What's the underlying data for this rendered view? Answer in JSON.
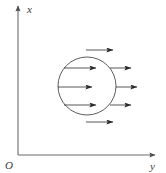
{
  "figure": {
    "background_color": "#ffffff",
    "width": 166,
    "height": 173,
    "stroke_color": "#4a4a4a",
    "axis_color": "#6a6a6a",
    "arrow_color": "#2b2b2b"
  },
  "axes": {
    "vertical": {
      "label": "x",
      "label_x": 27,
      "label_y": 13,
      "x": 18,
      "y_top": 4,
      "y_bottom": 155,
      "arrow_direction": "up"
    },
    "horizontal": {
      "label": "y",
      "label_x": 152,
      "label_y": 169,
      "y": 155,
      "x_left": 18,
      "x_right": 157,
      "arrow_direction": "right"
    },
    "origin": {
      "label": "O",
      "label_x": 6,
      "label_y": 168
    }
  },
  "circle": {
    "name": "flux-circle",
    "cx": 87,
    "cy": 86,
    "r": 29,
    "fill": "none",
    "stroke": "#4a4a4a",
    "stroke_width": 0.9
  },
  "chart_data": {
    "type": "scatter",
    "xlabel": "y",
    "ylabel": "x",
    "grid": false,
    "legend": null,
    "annotations": [
      "O",
      "x",
      "y"
    ],
    "vectors": [
      {
        "id": "arrow-top-tangent",
        "x_start": 86,
        "y": 50,
        "x_end": 116,
        "direction": "right",
        "region": "tangent-top"
      },
      {
        "id": "arrow-inner-upper",
        "x_start": 64,
        "y": 68,
        "x_end": 99,
        "direction": "right",
        "region": "inside-circle"
      },
      {
        "id": "arrow-inner-middle",
        "x_start": 58,
        "y": 87,
        "x_end": 95,
        "direction": "right",
        "region": "inside-circle"
      },
      {
        "id": "arrow-inner-lower",
        "x_start": 64,
        "y": 105,
        "x_end": 99,
        "direction": "right",
        "region": "inside-circle"
      },
      {
        "id": "arrow-bottom-tangent",
        "x_start": 86,
        "y": 122,
        "x_end": 116,
        "direction": "right",
        "region": "tangent-bottom"
      },
      {
        "id": "arrow-outer-upper",
        "x_start": 110,
        "y": 68,
        "x_end": 134,
        "direction": "right",
        "region": "outside-circle"
      },
      {
        "id": "arrow-outer-middle",
        "x_start": 116,
        "y": 87,
        "x_end": 140,
        "direction": "right",
        "region": "outside-circle"
      },
      {
        "id": "arrow-outer-lower",
        "x_start": 110,
        "y": 105,
        "x_end": 134,
        "direction": "right",
        "region": "outside-circle"
      }
    ]
  }
}
